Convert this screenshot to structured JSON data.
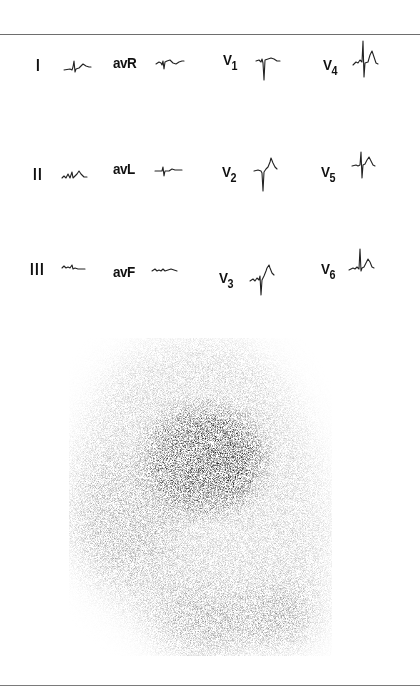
{
  "figure": {
    "type": "ECG 12-lead panel with myocardial scintigraphy image",
    "ecg": {
      "rows": [
        [
          {
            "id": "I",
            "label": "I",
            "sub": ""
          },
          {
            "id": "avR",
            "label": "avR",
            "sub": ""
          },
          {
            "id": "V1",
            "label": "V",
            "sub": "1"
          },
          {
            "id": "V4",
            "label": "V",
            "sub": "4"
          }
        ],
        [
          {
            "id": "II",
            "label": "II",
            "sub": ""
          },
          {
            "id": "avL",
            "label": "avL",
            "sub": ""
          },
          {
            "id": "V2",
            "label": "V",
            "sub": "2"
          },
          {
            "id": "V5",
            "label": "V",
            "sub": "5"
          }
        ],
        [
          {
            "id": "III",
            "label": "III",
            "sub": ""
          },
          {
            "id": "avF",
            "label": "avF",
            "sub": ""
          },
          {
            "id": "V3",
            "label": "V",
            "sub": "3"
          },
          {
            "id": "V6",
            "label": "V",
            "sub": "6"
          }
        ]
      ]
    },
    "scintigram": {
      "description": "Grayscale nuclear scan showing dense central uptake with diffuse surrounding activity and two lower lobes",
      "ink_color": "#1a1a1a",
      "background": "#ffffff"
    },
    "colors": {
      "rule": "#6e6e6e",
      "trace": "#222222",
      "label": "#111111"
    }
  }
}
